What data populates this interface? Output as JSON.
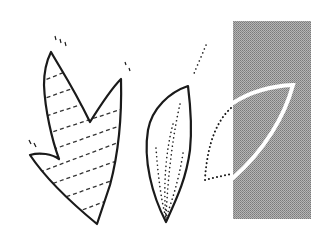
{
  "illustration": {
    "description": "Three leaf-cutting drawings: a striped double-pointed leaf, a dotted-vein almond leaf, and a white leaf outline on a gray halftone panel",
    "colors": {
      "background": "#ffffff",
      "ink": "#1a1a1a",
      "panel": "#9a9a9a",
      "panel_line": "#ffffff"
    },
    "shapes": [
      {
        "name": "striped-leaf",
        "style": "solid outline with dashed diagonal stripes"
      },
      {
        "name": "dotted-vein-leaf",
        "style": "solid outline with dotted veins"
      },
      {
        "name": "panel-leaf",
        "style": "white outline on gray panel, dotted continuation outside"
      }
    ]
  }
}
